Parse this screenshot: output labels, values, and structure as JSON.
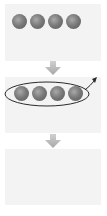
{
  "diagram": {
    "type": "process-flow",
    "orientation": "vertical",
    "panel_count": 3,
    "colors": {
      "background": "#ffffff",
      "panel": "#f3f3f3",
      "ball_light": "#a9a9a9",
      "ball_dark": "#555555",
      "flow_arrow": "#b5b5b5",
      "outline": "#2a2a2a"
    },
    "panels": [
      {
        "id": "step-1",
        "content": "four-spheres",
        "sphere_count": 4
      },
      {
        "id": "step-2",
        "content": "four-spheres-enclosed-in-ellipse",
        "sphere_count": 4,
        "enclosure": "ellipse",
        "exit_arrow": "upper-right"
      },
      {
        "id": "step-3",
        "content": "empty",
        "sphere_count": 0
      }
    ],
    "connectors": [
      {
        "from": "step-1",
        "to": "step-2",
        "icon": "arrow-down-icon"
      },
      {
        "from": "step-2",
        "to": "step-3",
        "icon": "arrow-down-icon"
      }
    ]
  }
}
